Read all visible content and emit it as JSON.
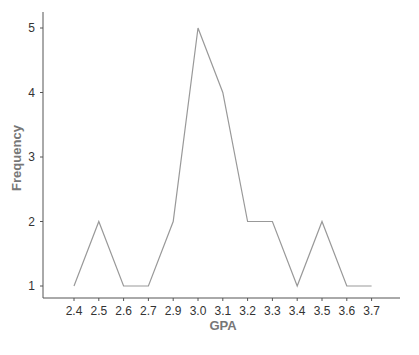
{
  "chart_data": {
    "type": "line",
    "title": "",
    "xlabel": "GPA",
    "ylabel": "Frequency",
    "categories": [
      "2.4",
      "2.5",
      "2.6",
      "2.7",
      "2.9",
      "3.0",
      "3.1",
      "3.2",
      "3.3",
      "3.4",
      "3.5",
      "3.6",
      "3.7"
    ],
    "values": [
      1,
      2,
      1,
      1,
      2,
      5,
      4,
      2,
      2,
      1,
      2,
      1,
      1
    ],
    "yticks": [
      1,
      2,
      3,
      4,
      5
    ],
    "ylim": [
      0.85,
      5.2
    ],
    "grid": false,
    "legend": null,
    "line_color": "#999999"
  },
  "cropped_header_text": "Frequency polygon of GPA"
}
